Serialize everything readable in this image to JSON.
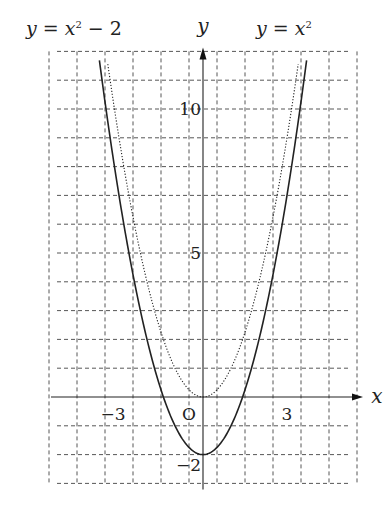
{
  "chart_data": {
    "type": "line",
    "title": "",
    "xlabel": "x",
    "ylabel": "y",
    "xlim": [
      -5,
      5
    ],
    "ylim": [
      -3,
      12
    ],
    "grid": true,
    "x_ticks": [
      {
        "value": -3,
        "label": "−3"
      },
      {
        "value": 3,
        "label": "3"
      }
    ],
    "y_ticks": [
      {
        "value": 10,
        "label": "10"
      },
      {
        "value": 5,
        "label": "5"
      },
      {
        "value": -2,
        "label": "−2"
      }
    ],
    "origin_label": "O",
    "series": [
      {
        "name": "y = x² − 2",
        "style": "solid",
        "formula": "x^2-2",
        "x": [
          -3.7,
          -3,
          -2,
          -1,
          0,
          1,
          2,
          3,
          3.7
        ],
        "values": [
          11.69,
          7,
          2,
          -1,
          -2,
          -1,
          2,
          7,
          11.69
        ]
      },
      {
        "name": "y = x²",
        "style": "dotted",
        "formula": "x^2",
        "x": [
          -3.4,
          -3,
          -2,
          -1,
          0,
          1,
          2,
          3,
          3.4
        ],
        "values": [
          11.56,
          9,
          4,
          1,
          0,
          1,
          4,
          9,
          11.56
        ]
      }
    ],
    "annotations": [
      {
        "text": "y = x² − 2",
        "position": "top-left"
      },
      {
        "text": "y = x²",
        "position": "top-right"
      }
    ]
  }
}
